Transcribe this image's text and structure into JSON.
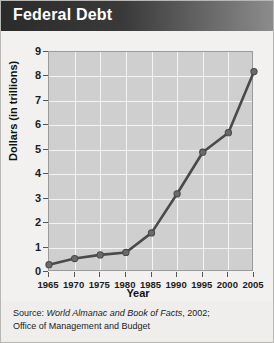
{
  "title": "Federal Debt",
  "source": {
    "prefix": "Source: ",
    "publication": "World Almanac and Book of Facts",
    "suffix": ", 2002;",
    "line2": "Office of Management and Budget"
  },
  "colors": {
    "title_bar_dark": "#2b2b2b",
    "title_bar_light": "#8d8d8d",
    "plot_background": "#cfcfcf",
    "gridline": "#f4f4f4",
    "line": "#4a4a4a",
    "marker": "#6a6a6a",
    "page_background": "#efeeec"
  },
  "chart_data": {
    "type": "line",
    "title": "Federal Debt",
    "xlabel": "Year",
    "ylabel": "Dollars (in trillions)",
    "x": [
      1965,
      1970,
      1975,
      1980,
      1985,
      1990,
      1995,
      2000,
      2005
    ],
    "values": [
      0.3,
      0.55,
      0.7,
      0.8,
      1.6,
      3.2,
      4.9,
      5.7,
      8.2
    ],
    "xticks": [
      "1965",
      "1970",
      "1975",
      "1980",
      "1985",
      "1990",
      "1995",
      "2000",
      "2005"
    ],
    "yticks": [
      "0",
      "1",
      "2",
      "3",
      "4",
      "5",
      "6",
      "7",
      "8",
      "9"
    ],
    "xlim": [
      1965,
      2005
    ],
    "ylim": [
      0,
      9
    ],
    "grid": true,
    "legend": false,
    "marker": "circle"
  }
}
